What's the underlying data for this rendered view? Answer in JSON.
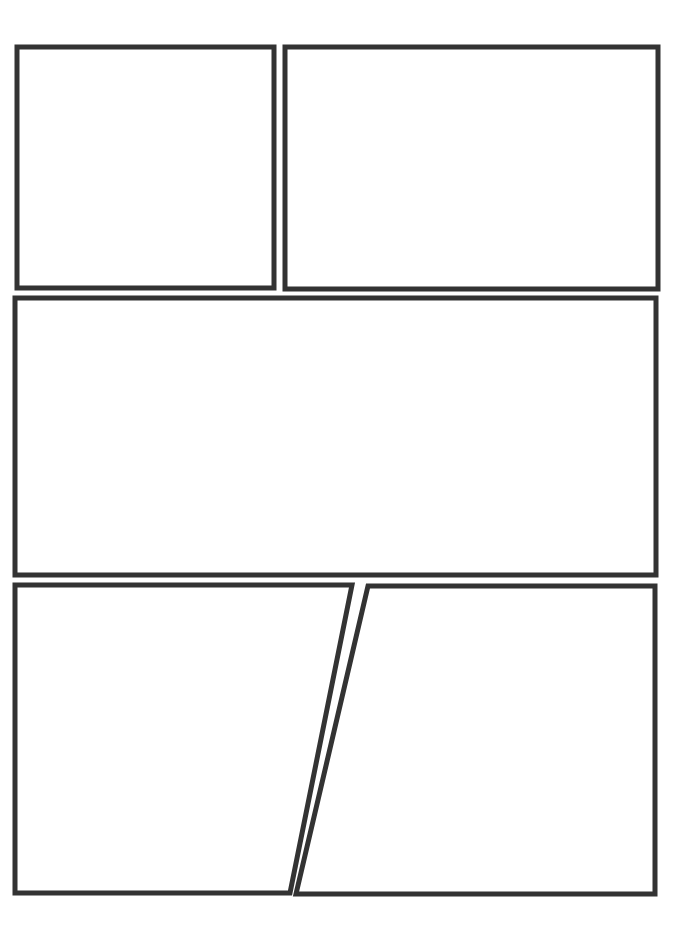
{
  "page": {
    "type": "comic-page-template",
    "background_color": "#ffffff",
    "border_color": "#333333",
    "border_width": 5,
    "width": 695,
    "height": 933
  },
  "panels": [
    {
      "id": "panel-1",
      "label": "Panel 1",
      "row": 1,
      "shape": "rectangle",
      "points": [
        [
          17,
          47
        ],
        [
          274,
          47
        ],
        [
          274,
          288
        ],
        [
          17,
          288
        ]
      ]
    },
    {
      "id": "panel-2",
      "label": "Panel 2",
      "row": 1,
      "shape": "rectangle",
      "points": [
        [
          285,
          47
        ],
        [
          658,
          47
        ],
        [
          658,
          289
        ],
        [
          285,
          289
        ]
      ]
    },
    {
      "id": "panel-3",
      "label": "Panel 3",
      "row": 2,
      "shape": "rectangle",
      "points": [
        [
          15,
          298
        ],
        [
          656,
          298
        ],
        [
          656,
          575
        ],
        [
          15,
          575
        ]
      ]
    },
    {
      "id": "panel-4",
      "label": "Panel 4",
      "row": 3,
      "shape": "trapezoid",
      "points": [
        [
          15,
          585
        ],
        [
          352,
          585
        ],
        [
          290,
          893
        ],
        [
          15,
          893
        ]
      ]
    },
    {
      "id": "panel-5",
      "label": "Panel 5",
      "row": 3,
      "shape": "trapezoid",
      "points": [
        [
          368,
          586
        ],
        [
          655,
          586
        ],
        [
          655,
          894
        ],
        [
          296,
          894
        ]
      ]
    }
  ]
}
